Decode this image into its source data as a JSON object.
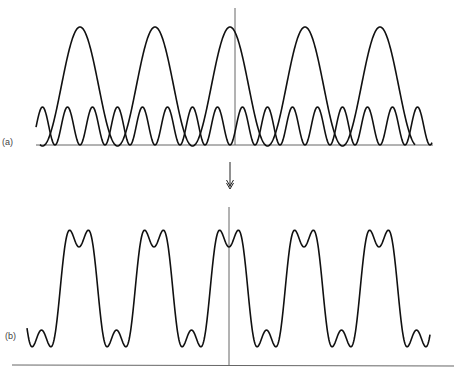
{
  "panels": {
    "a": {
      "label": "(a)",
      "description": "Fundamental wave plus third harmonic shown separately",
      "fundamental_peaks": 5,
      "harmonic": "3rd"
    },
    "b": {
      "label": "(b)",
      "description": "Resultant sum: approximately square wave with ripples"
    }
  },
  "arrow": {
    "direction": "down"
  },
  "colors": {
    "stroke": "#111111",
    "axis": "#555555",
    "background": "#ffffff"
  }
}
